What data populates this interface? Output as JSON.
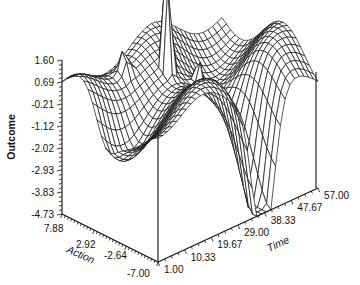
{
  "chart_data": {
    "type": "surface3d",
    "title": "",
    "zlabel": "Outcome",
    "xlabel": "Action",
    "ylabel": "Time",
    "z_ticks": [
      "1.60",
      "0.69",
      "-0.21",
      "-1.12",
      "-2.02",
      "-2.93",
      "-3.83",
      "-4.73"
    ],
    "x_ticks": [
      "7.88",
      "2.92",
      "-2.64",
      "-7.00"
    ],
    "y_ticks": [
      "1.00",
      "10.33",
      "19.67",
      "29.00",
      "38.33",
      "47.67",
      "57.00"
    ],
    "zlim": [
      -4.73,
      1.6
    ],
    "xlim": [
      -7.0,
      7.88
    ],
    "ylim": [
      1.0,
      57.0
    ],
    "grid": false,
    "style": "wireframe mesh, black lines on white",
    "annotations": [
      "Tall narrow spike near Time ~25, Action ~0 rising above the top of the plot",
      "Deep trough reaching about -4.7 near Time ~38, Action ~-7",
      "Surface mostly between -2.0 and 1.6 elsewhere"
    ]
  },
  "axes": {
    "z_title": "Outcome",
    "x_title": "Action",
    "y_title": "Time"
  }
}
